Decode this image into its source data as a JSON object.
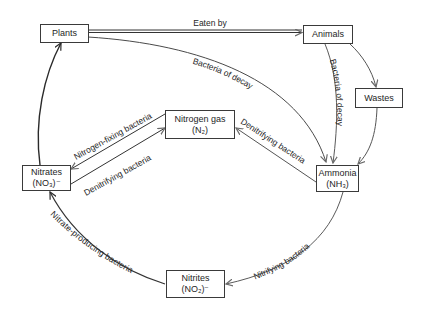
{
  "diagram": {
    "colors": {
      "line": "#333333",
      "grey_line": "#6a6a6a",
      "box_border": "#3a3a3a",
      "text": "#1e1e1e"
    },
    "nodes": {
      "plants": {
        "line1": "Plants"
      },
      "animals": {
        "line1": "Animals"
      },
      "wastes": {
        "line1": "Wastes"
      },
      "nitrogen_gas": {
        "line1": "Nitrogen gas",
        "line2": "(N₂)"
      },
      "nitrates": {
        "line1": "Nitrates",
        "line2": "(NO₃)⁻"
      },
      "ammonia": {
        "line1": "Ammonia",
        "line2": "(NH₃)"
      },
      "nitrites": {
        "line1": "Nitrites",
        "line2": "(NO₂)⁻"
      }
    },
    "edges": {
      "plants_to_animals": {
        "from": "Plants",
        "to": "Animals",
        "label": "Eaten by"
      },
      "plants_to_ammonia": {
        "from": "Plants",
        "to": "Ammonia",
        "label": "Bacteria of decay"
      },
      "animals_to_ammonia": {
        "from": "Animals",
        "to": "Ammonia",
        "label": "Bacteria of decay"
      },
      "animals_to_wastes": {
        "from": "Animals",
        "to": "Wastes",
        "label": ""
      },
      "wastes_to_ammonia": {
        "from": "Wastes",
        "to": "Ammonia",
        "label": ""
      },
      "ammonia_to_nitrogen_gas": {
        "from": "Ammonia",
        "to": "Nitrogen gas",
        "label": "Denitrifying bacteria"
      },
      "nitrogen_gas_to_nitrates": {
        "from": "Nitrogen gas",
        "to": "Nitrates",
        "label": "Nitrogen-fixing bacteria"
      },
      "nitrates_to_nitrogen_gas": {
        "from": "Nitrates",
        "to": "Nitrogen gas",
        "label": "Denitrifying bacteria"
      },
      "ammonia_to_nitrites": {
        "from": "Ammonia",
        "to": "Nitrites",
        "label": "Nitrifying bacteria"
      },
      "nitrites_to_nitrates": {
        "from": "Nitrites",
        "to": "Nitrates",
        "label": "Nitrate-producing bacteria"
      },
      "nitrates_to_plants": {
        "from": "Nitrates",
        "to": "Plants",
        "label": ""
      }
    }
  }
}
